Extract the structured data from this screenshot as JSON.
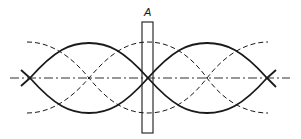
{
  "diagram": {
    "type": "standing-wave-nodes",
    "label_A": "A",
    "colors": {
      "stroke": "#1a1a1a",
      "background": "#ffffff"
    },
    "centerline": {
      "x1": 10,
      "x2": 290,
      "y": 78,
      "style": "dash-dot"
    },
    "solid_waves": {
      "nodes_x": [
        30,
        148,
        267
      ],
      "amplitude": 35
    },
    "dashed_waves": {
      "nodes_x": [
        89,
        207
      ],
      "x_range": [
        27,
        268
      ],
      "amplitude": 35
    },
    "rectangle": {
      "x": 142,
      "y": 22,
      "width": 11,
      "height": 111
    }
  }
}
